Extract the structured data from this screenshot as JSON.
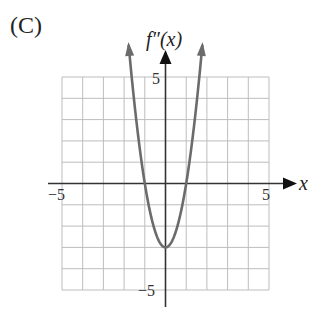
{
  "panel": {
    "label": "(C)"
  },
  "axes": {
    "x_label": "x",
    "y_label": "f″(x)",
    "x_ticks": {
      "neg": "−5",
      "pos": "5"
    },
    "y_ticks": {
      "pos": "5",
      "neg": "−5"
    }
  },
  "colors": {
    "curve": "#6b6b6b",
    "grid": "#bdbdbd",
    "axis": "#333333"
  },
  "chart_data": {
    "type": "line",
    "title": "(C)",
    "xlabel": "x",
    "ylabel": "f''(x)",
    "xlim": [
      -5,
      5
    ],
    "ylim": [
      -5,
      5
    ],
    "grid": true,
    "grid_step": 1,
    "x_tick_labels": [
      "-5",
      "5"
    ],
    "y_tick_labels": [
      "5",
      "-5"
    ],
    "series": [
      {
        "name": "f''(x)",
        "description": "upward-opening parabola, vertex at (0,-3), zeros at x=-1 and x=1, arrows on both ends going up",
        "x": [
          -1.75,
          -1.5,
          -1.0,
          -0.5,
          0,
          0.5,
          1.0,
          1.5,
          1.75
        ],
        "y": [
          6.2,
          3.75,
          0,
          -2.25,
          -3,
          -2.25,
          0,
          3.75,
          6.2
        ]
      }
    ]
  }
}
